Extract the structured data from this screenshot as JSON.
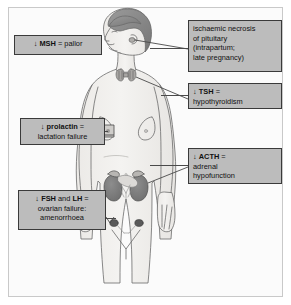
{
  "diagram": {
    "colors": {
      "box_fill": "#bcbcbc",
      "box_border": "#3a3a3a",
      "leader_line": "#4a4a4a",
      "body_outline": "#6b6b6b",
      "body_fill": "#f0efed",
      "hair": "#8c8c8c",
      "kidney": "#7a7a7a",
      "ovary": "#5a5a5a",
      "frame_border": "#c9c9c9",
      "background": "#fbfbfb"
    }
  },
  "callouts": [
    {
      "id": "msh",
      "arrow": "↓",
      "hormone": "MSH",
      "equals": "=",
      "lines": [
        "↓ MSH = pallor"
      ],
      "effect": "pallor",
      "target": "skin"
    },
    {
      "id": "pituitary",
      "arrow": "",
      "hormone": "",
      "equals": "",
      "lines": [
        "ischaemic necrosis",
        "of pituitary",
        "(intrapartum;",
        "late pregnancy)"
      ],
      "effect": "ischaemic necrosis of pituitary (intrapartum; late pregnancy)",
      "target": "pituitary gland"
    },
    {
      "id": "tsh",
      "arrow": "↓",
      "hormone": "TSH",
      "equals": "=",
      "lines": [
        "↓ TSH =",
        "hypothyroidism"
      ],
      "effect": "hypothyroidism",
      "target": "thyroid gland"
    },
    {
      "id": "prolactin",
      "arrow": "↓",
      "hormone": "prolactin",
      "equals": "=",
      "lines": [
        "↓ prolactin =",
        "lactation failure"
      ],
      "effect": "lactation failure",
      "target": "breast"
    },
    {
      "id": "acth",
      "arrow": "↓",
      "hormone": "ACTH",
      "equals": "=",
      "lines": [
        "↓ ACTH =",
        "adrenal",
        "hypofunction"
      ],
      "effect": "adrenal hypofunction",
      "target": "adrenal glands"
    },
    {
      "id": "fshlh",
      "arrow": "↓",
      "hormone": "FSH and LH",
      "equals": "=",
      "lines": [
        "↓ FSH and LH =",
        "ovarian failure:",
        "amenorrhoea"
      ],
      "effect": "ovarian failure: amenorrhoea",
      "target": "ovaries"
    }
  ],
  "box_text": {
    "msh_l1_arrow": "↓",
    "msh_l1_bold": "MSH",
    "msh_l1_rest": "= pallor",
    "pit_l1": "ischaemic necrosis",
    "pit_l2": "of pituitary",
    "pit_l3": "(intrapartum;",
    "pit_l4": "late pregnancy)",
    "tsh_l1_arrow": "↓",
    "tsh_l1_bold": "TSH",
    "tsh_l1_rest": "=",
    "tsh_l2": "hypothyroidism",
    "prl_l1_arrow": "↓",
    "prl_l1_bold": "prolactin",
    "prl_l1_rest": "=",
    "prl_l2": "lactation failure",
    "acth_l1_arrow": "↓",
    "acth_l1_bold": "ACTH",
    "acth_l1_rest": "=",
    "acth_l2": "adrenal",
    "acth_l3": "hypofunction",
    "fsh_l1_arrow": "↓",
    "fsh_l1_bold1": "FSH",
    "fsh_l1_mid": "and",
    "fsh_l1_bold2": "LH",
    "fsh_l1_rest": "=",
    "fsh_l2": "ovarian failure:",
    "fsh_l3": "amenorrhoea"
  },
  "organs": [
    {
      "name": "pituitary",
      "label": "pituitary gland"
    },
    {
      "name": "thyroid",
      "label": "thyroid gland"
    },
    {
      "name": "breast",
      "label": "breast marker"
    },
    {
      "name": "kidneys",
      "label": "kidneys with adrenal glands"
    },
    {
      "name": "ovaries",
      "label": "ovaries"
    }
  ]
}
